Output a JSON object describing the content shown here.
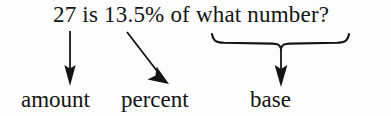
{
  "figure": {
    "type": "annotated-equation-diagram",
    "background_color": "#fdfdfd",
    "ink_color": "#141414",
    "question": "27 is 13.5% of what number?",
    "question_parts": {
      "amount_value": "27",
      "connector_1": "is",
      "percent_value": "13.5%",
      "connector_2": "of",
      "base_phrase": "what number?"
    },
    "labels": [
      {
        "id": "amount",
        "text": "amount",
        "points_to": "27",
        "connector": "straight-down-arrow"
      },
      {
        "id": "percent",
        "text": "percent",
        "points_to": "13.5%",
        "connector": "diagonal-arrow"
      },
      {
        "id": "base",
        "text": "base",
        "points_to": "what number?",
        "connector": "brace-and-arrow"
      }
    ],
    "brace": {
      "spans": "what number?",
      "orientation": "horizontal-underbrace",
      "left_x": 212,
      "right_x": 348,
      "center_x": 281
    }
  }
}
